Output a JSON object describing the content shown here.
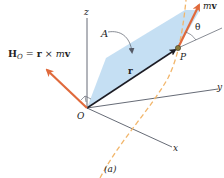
{
  "diagram": {
    "caption": "(a)",
    "labels": {
      "angular_momentum_H": "H",
      "angular_momentum_sub": "O",
      "equation_eq": " = ",
      "equation_r": "r",
      "equation_times": " × ",
      "equation_m": "m",
      "equation_v": "v",
      "plane": "A",
      "position_vector": "r",
      "point": "P",
      "origin": "O",
      "angle": "θ",
      "momentum_m": "m",
      "momentum_v": "v",
      "axis_x": "x",
      "axis_y": "y",
      "axis_z": "z"
    },
    "colors": {
      "vector_orange": "#e06a3c",
      "path_dashed": "#f2b66b",
      "plane_fill": "#bfdcf2",
      "axis": "#555a66",
      "position_vector": "#1c1c24",
      "point_fill": "#8a7a3a",
      "text": "#222222"
    }
  }
}
